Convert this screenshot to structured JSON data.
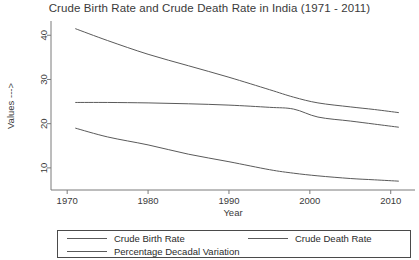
{
  "chart_data": {
    "type": "line",
    "title": "Crude Birth Rate and Crude Death Rate in India (1971 - 2011)",
    "xlabel": "Year",
    "ylabel": "Values --->",
    "xlim": [
      1968,
      2013
    ],
    "ylim": [
      5,
      43
    ],
    "grid": false,
    "legend_position": "bottom",
    "xticks": [
      1970,
      1980,
      1990,
      2000,
      2010
    ],
    "xtick_labels": [
      "1970",
      "1980",
      "1990",
      "2000",
      "2010"
    ],
    "yticks": [
      10,
      20,
      30,
      40
    ],
    "ytick_labels": [
      "10",
      "20",
      "30",
      "40"
    ],
    "x": [
      1971,
      1975,
      1980,
      1985,
      1990,
      1995,
      1998,
      2001,
      2005,
      2008,
      2011
    ],
    "series": [
      {
        "name": "Crude Birth Rate",
        "color": "#5a5a5a",
        "values": [
          41.5,
          38.8,
          35.7,
          33.1,
          30.5,
          27.7,
          26.0,
          24.7,
          23.8,
          23.2,
          22.5
        ]
      },
      {
        "name": "Crude Death Rate",
        "color": "#5a5a5a",
        "values": [
          19.0,
          17.0,
          15.2,
          13.1,
          11.4,
          9.6,
          8.8,
          8.2,
          7.6,
          7.3,
          7.0
        ]
      },
      {
        "name": "Percentage Decadal Variation",
        "color": "#5a5a5a",
        "values": [
          24.8,
          24.8,
          24.7,
          24.5,
          24.2,
          23.7,
          23.3,
          21.5,
          20.6,
          19.9,
          19.2
        ]
      }
    ]
  },
  "legend": {
    "items": [
      {
        "label": "Crude Birth Rate"
      },
      {
        "label": "Percentage Decadal Variation"
      },
      {
        "label": "Crude Death Rate"
      }
    ]
  }
}
